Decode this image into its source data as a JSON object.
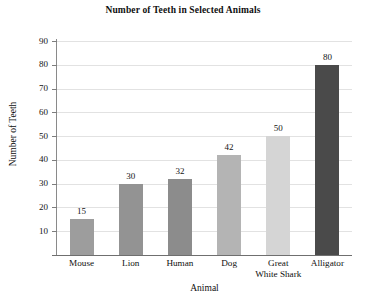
{
  "chart_data": {
    "type": "bar",
    "title": "Number of Teeth in Selected Animals",
    "xlabel": "Animal",
    "ylabel": "Number of Teeth",
    "categories": [
      "Mouse",
      "Lion",
      "Human",
      "Dog",
      "Great White Shark",
      "Alligator"
    ],
    "category_lines": [
      [
        "Mouse"
      ],
      [
        "Lion"
      ],
      [
        "Human"
      ],
      [
        "Dog"
      ],
      [
        "Great",
        "White Shark"
      ],
      [
        "Alligator"
      ]
    ],
    "values": [
      15,
      30,
      32,
      42,
      50,
      80
    ],
    "value_labels": [
      "15",
      "30",
      "32",
      "42",
      "50",
      "80"
    ],
    "bar_colors": [
      "#9d9d9d",
      "#939393",
      "#8c8c8c",
      "#b4b4b4",
      "#d5d5d5",
      "#4a4a4a"
    ],
    "ylim": [
      0,
      90
    ],
    "ytick_labels": [
      "10",
      "20",
      "30",
      "40",
      "50",
      "60",
      "70",
      "80",
      "90"
    ],
    "ytick_values": [
      10,
      20,
      30,
      40,
      50,
      60,
      70,
      80,
      90
    ],
    "grid": true,
    "grid_color": "#e2e2e2",
    "axis_color": "#7d7d7d",
    "legend": null,
    "background": "#ffffff"
  }
}
